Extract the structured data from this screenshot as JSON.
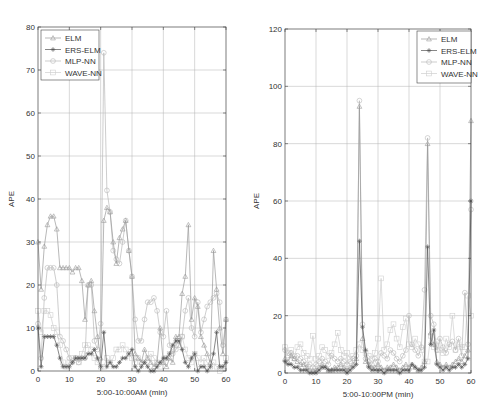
{
  "chart_data": [
    {
      "type": "line",
      "title": "",
      "xlabel": "5:00-10:00AM (min)",
      "ylabel": "APE",
      "xlim": [
        0,
        60
      ],
      "ylim": [
        0,
        80
      ],
      "xticks": [
        0,
        10,
        20,
        30,
        40,
        50,
        60
      ],
      "yticks": [
        0,
        10,
        20,
        30,
        40,
        50,
        60,
        70,
        80
      ],
      "grid": true,
      "legend_position": "upper-left",
      "x": [
        0,
        1,
        2,
        3,
        4,
        5,
        6,
        7,
        8,
        9,
        10,
        11,
        12,
        13,
        14,
        15,
        16,
        17,
        18,
        19,
        20,
        21,
        22,
        23,
        24,
        25,
        26,
        27,
        28,
        29,
        30,
        31,
        32,
        33,
        34,
        35,
        36,
        37,
        38,
        39,
        40,
        41,
        42,
        43,
        44,
        45,
        46,
        47,
        48,
        49,
        50,
        51,
        52,
        53,
        54,
        55,
        56,
        57,
        58,
        59,
        60
      ],
      "series": [
        {
          "name": "ELM",
          "marker": "triangle",
          "values": [
            30,
            19,
            29,
            34,
            36,
            36,
            33,
            24,
            24,
            24,
            24,
            23,
            24,
            24,
            21,
            12,
            20,
            21,
            14,
            8,
            3,
            35,
            38,
            37,
            30,
            25,
            31,
            33,
            35,
            28,
            22,
            4,
            3,
            2,
            5,
            3,
            2,
            1,
            2,
            10,
            2,
            1,
            3,
            2,
            8,
            8,
            18,
            22,
            34,
            12,
            17,
            15,
            8,
            6,
            4,
            2,
            28,
            19,
            10,
            4,
            12
          ]
        },
        {
          "name": "ERS-ELM",
          "marker": "star",
          "values": [
            10,
            1,
            8,
            8,
            8,
            8,
            6,
            3,
            1,
            1,
            1,
            2,
            3,
            3,
            3,
            3,
            4,
            4,
            5,
            3,
            1,
            9,
            1,
            2,
            1,
            1,
            2,
            3,
            3,
            4,
            5,
            1,
            0,
            1,
            2,
            1,
            0,
            0,
            1,
            2,
            3,
            3,
            4,
            6,
            7,
            7,
            5,
            2,
            1,
            3,
            4,
            0,
            1,
            1,
            0,
            1,
            4,
            9,
            1,
            1,
            2
          ]
        },
        {
          "name": "MLP-NN",
          "marker": "circle",
          "values": [
            11,
            3,
            17,
            24,
            24,
            24,
            20,
            8,
            7,
            5,
            3,
            2,
            3,
            2,
            3,
            3,
            20,
            20,
            7,
            5,
            11,
            74,
            42,
            37,
            28,
            26,
            25,
            30,
            35,
            28,
            22,
            12,
            7,
            7,
            12,
            16,
            16,
            17,
            14,
            9,
            8,
            14,
            6,
            4,
            5,
            6,
            8,
            14,
            17,
            10,
            8,
            16,
            9,
            12,
            15,
            16,
            17,
            18,
            16,
            6,
            12
          ]
        },
        {
          "name": "WAVE-NN",
          "marker": "square",
          "values": [
            14,
            9,
            14,
            14,
            13,
            10,
            9,
            6,
            2,
            1,
            2,
            3,
            3,
            2,
            4,
            6,
            6,
            5,
            3,
            2,
            1,
            1,
            3,
            2,
            3,
            5,
            5,
            6,
            5,
            4,
            3,
            2,
            3,
            2,
            2,
            3,
            4,
            3,
            2,
            1,
            2,
            3,
            4,
            5,
            6,
            7,
            8,
            5,
            3,
            2,
            4,
            3,
            2,
            3,
            2,
            1,
            2,
            1,
            0,
            1,
            3
          ]
        }
      ],
      "colors": {
        "ELM": "#9a9a9a",
        "ERS-ELM": "#555555",
        "MLP-NN": "#b8b8b8",
        "WAVE-NN": "#cfcfcf"
      }
    },
    {
      "type": "line",
      "title": "",
      "xlabel": "5:00-10:00PM (min)",
      "ylabel": "APE",
      "xlim": [
        0,
        60
      ],
      "ylim": [
        0,
        120
      ],
      "xticks": [
        0,
        10,
        20,
        30,
        40,
        50,
        60
      ],
      "yticks": [
        0,
        20,
        40,
        60,
        80,
        100,
        120
      ],
      "grid": true,
      "legend_position": "upper-right",
      "x": [
        0,
        1,
        2,
        3,
        4,
        5,
        6,
        7,
        8,
        9,
        10,
        11,
        12,
        13,
        14,
        15,
        16,
        17,
        18,
        19,
        20,
        21,
        22,
        23,
        24,
        25,
        26,
        27,
        28,
        29,
        30,
        31,
        32,
        33,
        34,
        35,
        36,
        37,
        38,
        39,
        40,
        41,
        42,
        43,
        44,
        45,
        46,
        47,
        48,
        49,
        50,
        51,
        52,
        53,
        54,
        55,
        56,
        57,
        58,
        59,
        60
      ],
      "series": [
        {
          "name": "ELM",
          "marker": "triangle",
          "values": [
            5,
            4,
            6,
            5,
            4,
            3,
            3,
            2,
            1,
            1,
            1,
            2,
            3,
            2,
            1,
            1,
            2,
            2,
            3,
            2,
            1,
            2,
            3,
            5,
            93,
            12,
            4,
            3,
            2,
            2,
            3,
            2,
            1,
            2,
            2,
            3,
            2,
            1,
            2,
            3,
            2,
            3,
            2,
            1,
            2,
            4,
            80,
            14,
            10,
            4,
            3,
            2,
            3,
            2,
            3,
            4,
            5,
            4,
            6,
            8,
            88
          ]
        },
        {
          "name": "ERS-ELM",
          "marker": "star",
          "values": [
            4,
            3,
            3,
            2,
            2,
            1,
            1,
            1,
            0,
            0,
            0,
            1,
            2,
            2,
            1,
            1,
            1,
            1,
            1,
            1,
            0,
            1,
            2,
            3,
            46,
            16,
            8,
            2,
            1,
            1,
            1,
            1,
            0,
            1,
            1,
            1,
            1,
            0,
            1,
            1,
            1,
            3,
            2,
            1,
            1,
            2,
            44,
            10,
            15,
            3,
            2,
            1,
            2,
            1,
            2,
            2,
            3,
            2,
            3,
            5,
            60
          ]
        },
        {
          "name": "MLP-NN",
          "marker": "circle",
          "values": [
            8,
            6,
            7,
            5,
            6,
            5,
            4,
            3,
            3,
            2,
            3,
            4,
            5,
            4,
            3,
            6,
            5,
            4,
            5,
            4,
            3,
            4,
            5,
            6,
            95,
            17,
            5,
            4,
            3,
            5,
            4,
            7,
            6,
            5,
            8,
            7,
            5,
            4,
            6,
            8,
            20,
            10,
            8,
            6,
            9,
            29,
            82,
            20,
            17,
            8,
            12,
            9,
            7,
            10,
            11,
            8,
            12,
            6,
            28,
            10,
            57
          ]
        },
        {
          "name": "WAVE-NN",
          "marker": "square",
          "values": [
            9,
            7,
            8,
            6,
            9,
            10,
            7,
            6,
            5,
            13,
            5,
            6,
            9,
            8,
            6,
            7,
            10,
            14,
            8,
            6,
            7,
            5,
            6,
            8,
            10,
            8,
            7,
            6,
            5,
            7,
            12,
            33,
            8,
            10,
            15,
            17,
            12,
            9,
            16,
            19,
            10,
            9,
            12,
            10,
            8,
            4,
            4,
            13,
            9,
            11,
            8,
            7,
            12,
            9,
            20,
            8,
            10,
            9,
            9,
            27,
            20
          ]
        }
      ],
      "colors": {
        "ELM": "#9a9a9a",
        "ERS-ELM": "#555555",
        "MLP-NN": "#b8b8b8",
        "WAVE-NN": "#cfcfcf"
      }
    }
  ],
  "figure": {
    "panels": [
      {
        "left": 38,
        "right": 226,
        "top": 27,
        "bottom": 371,
        "legend": {
          "x": 41,
          "y": 30,
          "w": 58,
          "h": 50
        }
      },
      {
        "left": 285,
        "right": 471,
        "top": 29,
        "bottom": 373,
        "legend": {
          "x": 417,
          "y": 31,
          "w": 54,
          "h": 52
        }
      }
    ]
  }
}
